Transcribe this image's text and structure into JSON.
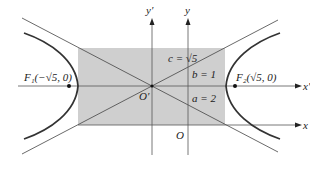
{
  "diagram": {
    "type": "hyperbola-translation",
    "colors": {
      "rectangle_fill": "#cfcfcf",
      "axis": "#555555",
      "curve": "#333333",
      "asymptote": "#444444",
      "background": "#ffffff"
    },
    "labels": {
      "y_prime_axis": "y′",
      "y_axis": "y",
      "x_prime_axis": "x′",
      "x_axis": "x",
      "origin_prime": "O′",
      "origin": "O",
      "c_value": "c = √5",
      "b_value": "b = 1",
      "a_value": "a = 2",
      "focus_1": "F₁(−√5, 0)",
      "focus_2": "F₂(√5, 0)"
    },
    "params": {
      "a": 2,
      "b": 1,
      "c": "√5"
    }
  }
}
